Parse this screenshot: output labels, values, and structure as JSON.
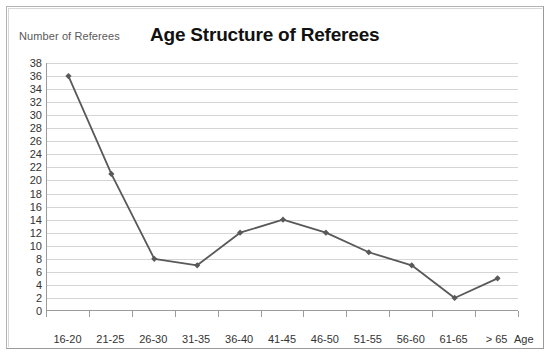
{
  "chart_data": {
    "type": "line",
    "title": "Age Structure of Referees",
    "xlabel": "Age",
    "ylabel": "Number of Referees",
    "categories": [
      "16-20",
      "21-25",
      "26-30",
      "31-35",
      "36-40",
      "41-45",
      "46-50",
      "51-55",
      "56-60",
      "61-65",
      "> 65"
    ],
    "values": [
      36,
      21,
      8,
      7,
      12,
      14,
      12,
      9,
      7,
      2,
      5
    ],
    "ylim": [
      0,
      38
    ],
    "ytick_step": 2,
    "yticks": [
      38,
      36,
      34,
      32,
      30,
      28,
      26,
      24,
      22,
      20,
      18,
      16,
      14,
      12,
      10,
      8,
      6,
      4,
      2,
      0
    ],
    "grid": true,
    "legend": false,
    "series_color": "#595959",
    "gridline_color": "#d5d5d5",
    "axis_color": "#9b9b9b",
    "marker": "diamond"
  }
}
